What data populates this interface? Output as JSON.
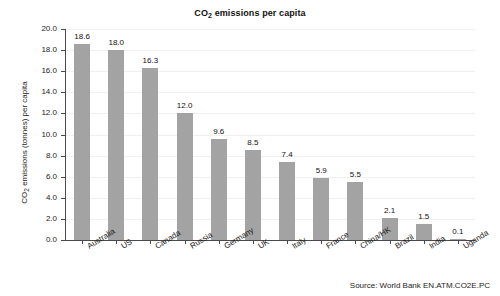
{
  "chart_data": {
    "type": "bar",
    "title": "CO2 emissions per capita",
    "title_prefix": "CO",
    "title_sub": "2",
    "title_suffix": " emissions per capita",
    "xlabel": "",
    "ylabel": "CO2 emissions (tonnes) per capita",
    "ylabel_prefix": "CO",
    "ylabel_sub": "2",
    "ylabel_suffix": " emissions (tonnes) per capita",
    "categories": [
      "Australia",
      "US",
      "Canada",
      "Russia",
      "Germany",
      "UK",
      "Italy",
      "France",
      "China/HK",
      "Brazil",
      "India",
      "Uganda"
    ],
    "values": [
      18.6,
      18.0,
      16.3,
      12.0,
      9.6,
      8.5,
      7.4,
      5.9,
      5.5,
      2.1,
      1.5,
      0.1
    ],
    "value_labels": [
      "18.6",
      "18.0",
      "16.3",
      "12.0",
      "9.6",
      "8.5",
      "7.4",
      "5.9",
      "5.5",
      "2.1",
      "1.5",
      "0.1"
    ],
    "ylim": [
      0.0,
      20.0
    ],
    "ytick_step": 2.0,
    "ytick_labels": [
      "20.0",
      "18.0",
      "16.0",
      "14.0",
      "12.0",
      "10.0",
      "8.0",
      "6.0",
      "4.0",
      "2.0",
      "0.0"
    ],
    "ytick_values": [
      20.0,
      18.0,
      16.0,
      14.0,
      12.0,
      10.0,
      8.0,
      6.0,
      4.0,
      2.0,
      0.0
    ],
    "grid": true,
    "grid_axis": "y",
    "legend": false,
    "bar_color": "#a3a3a3",
    "grid_color": "#f0f0f0",
    "axis_color": "#4a4a4a",
    "text_color": "#1c1c1c",
    "background_color": "#ffffff"
  },
  "source": {
    "text": "Source: World Bank EN.ATM.CO2E.PC"
  }
}
